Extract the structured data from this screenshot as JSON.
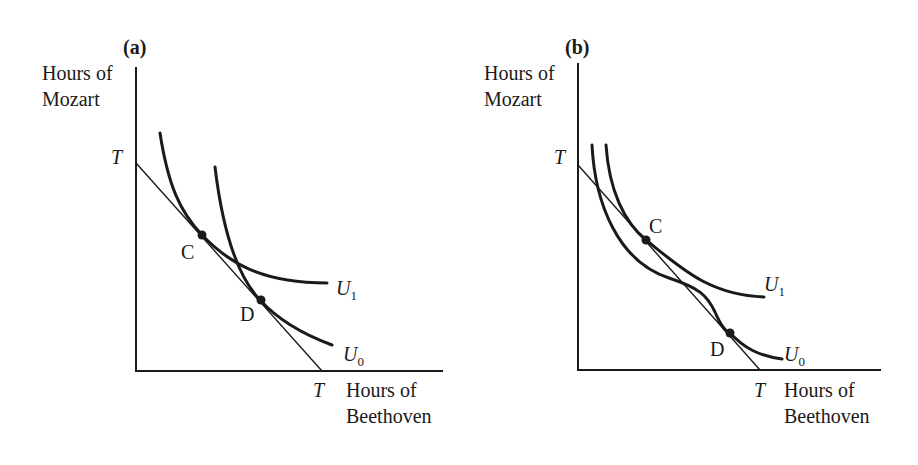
{
  "figure": {
    "panels": [
      {
        "id": "a",
        "label": "(a)",
        "y_axis_label_line1": "Hours of",
        "y_axis_label_line2": "Mozart",
        "x_axis_label_line1": "Hours of",
        "x_axis_label_line2": "Beethoven",
        "y_intercept_label": "T",
        "x_intercept_label": "T",
        "point_c_label": "C",
        "point_d_label": "D",
        "curve_u1_label": "U",
        "curve_u1_sub": "1",
        "curve_u0_label": "U",
        "curve_u0_sub": "0"
      },
      {
        "id": "b",
        "label": "(b)",
        "y_axis_label_line1": "Hours of",
        "y_axis_label_line2": "Mozart",
        "x_axis_label_line1": "Hours of",
        "x_axis_label_line2": "Beethoven",
        "y_intercept_label": "T",
        "x_intercept_label": "T",
        "point_c_label": "C",
        "point_d_label": "D",
        "curve_u1_label": "U",
        "curve_u1_sub": "1",
        "curve_u0_label": "U",
        "curve_u0_sub": "0"
      }
    ]
  },
  "colors": {
    "ink": "#1a1a1a",
    "background": "#ffffff"
  }
}
